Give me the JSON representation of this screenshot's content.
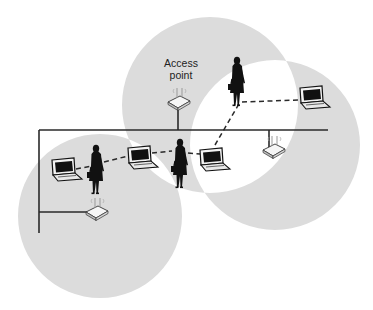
{
  "diagram": {
    "title_label": {
      "line1": "Access",
      "line2": "point"
    },
    "colors": {
      "coverage_fill": "#dcdcdc",
      "background": "#ffffff",
      "wire": "#2a2a2a",
      "link": "#2a2a2a",
      "device_dark": "#111111",
      "ap_body": "#f4f4f4"
    },
    "coverage_areas": [
      {
        "id": "cell-top",
        "name": "top access point coverage"
      },
      {
        "id": "cell-right",
        "name": "right access point coverage"
      },
      {
        "id": "cell-left",
        "name": "lower-left access point coverage"
      }
    ],
    "access_points": [
      {
        "id": "ap-top",
        "icon": "wireless-access-point-icon",
        "labelled": true
      },
      {
        "id": "ap-right",
        "icon": "wireless-access-point-icon",
        "labelled": false
      },
      {
        "id": "ap-left",
        "icon": "wireless-access-point-icon",
        "labelled": false
      }
    ],
    "laptops": [
      {
        "id": "laptop-left",
        "icon": "laptop-icon"
      },
      {
        "id": "laptop-middle",
        "icon": "laptop-icon"
      },
      {
        "id": "laptop-center-right",
        "icon": "laptop-icon"
      },
      {
        "id": "laptop-far-right",
        "icon": "laptop-icon"
      }
    ],
    "people": [
      {
        "id": "person-left",
        "icon": "person-with-briefcase-icon"
      },
      {
        "id": "person-center",
        "icon": "person-with-briefcase-icon"
      },
      {
        "id": "person-top",
        "icon": "person-with-briefcase-icon"
      }
    ],
    "wireless_links": [
      {
        "from": "laptop-left",
        "to": "person-left"
      },
      {
        "from": "person-left",
        "to": "laptop-middle"
      },
      {
        "from": "laptop-middle",
        "to": "person-center"
      },
      {
        "from": "person-center",
        "to": "laptop-center-right"
      },
      {
        "from": "laptop-center-right",
        "to": "person-top"
      },
      {
        "from": "person-top",
        "to": "laptop-far-right"
      }
    ],
    "wired_backbone": {
      "name": "wired distribution network",
      "connects": [
        "ap-top",
        "ap-right",
        "ap-left"
      ]
    }
  }
}
